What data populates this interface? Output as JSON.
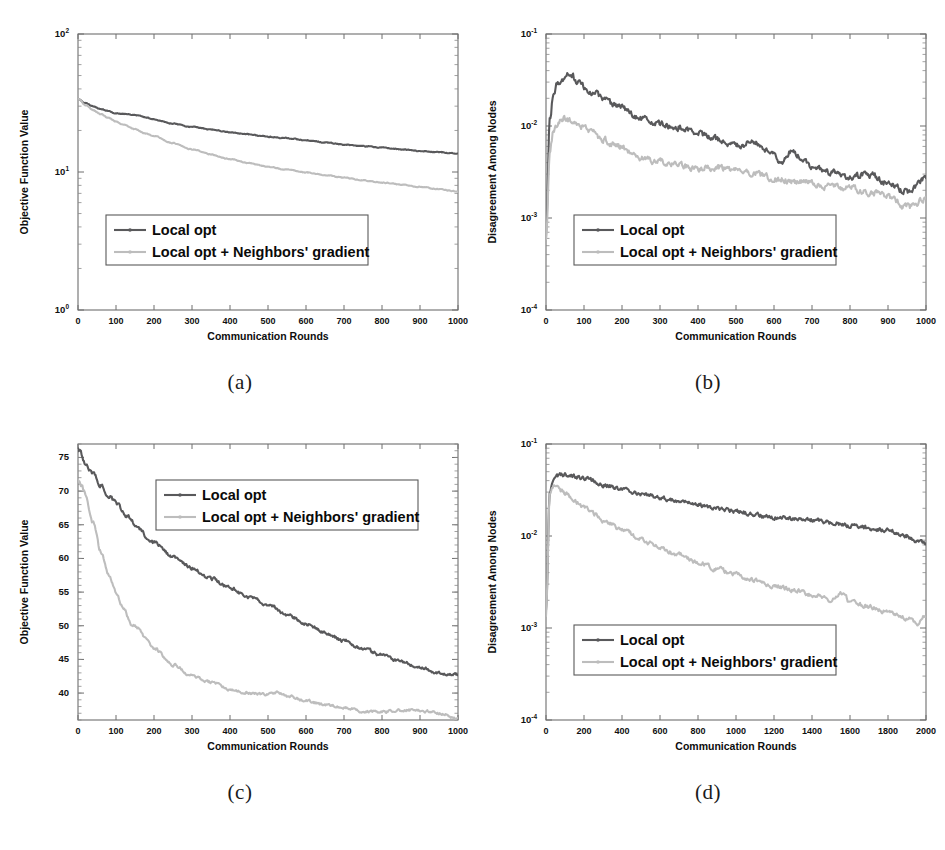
{
  "figure": {
    "background": "#ffffff",
    "colors": {
      "series_dark": "#59595b",
      "series_light": "#bdbdbd",
      "axis": "#6e6e6e",
      "text": "#111111",
      "legend_border": "#5a5a5a"
    },
    "legend_labels": {
      "local_opt": "Local opt",
      "local_opt_neighbors": "Local opt + Neighbors' gradient"
    },
    "axis_titles": {
      "x_rounds": "Communication Rounds",
      "y_objective": "Objective Function Value",
      "y_disagreement": "Disagreement Among Nodes"
    },
    "captions": {
      "a": "(a)",
      "b": "(b)",
      "c": "(c)",
      "d": "(d)"
    }
  },
  "chart_data": [
    {
      "id": "a",
      "type": "line",
      "title": "",
      "caption": "(a)",
      "xlabel": "Communication Rounds",
      "ylabel": "Objective Function Value",
      "xscale": "linear",
      "yscale": "log",
      "xlim": [
        0,
        1000
      ],
      "ylim": [
        1,
        100
      ],
      "xticks": [
        0,
        100,
        200,
        300,
        400,
        500,
        600,
        700,
        800,
        900,
        1000
      ],
      "xticklabels": [
        "0",
        "100",
        "200",
        "300",
        "400",
        "500",
        "600",
        "700",
        "800",
        "900",
        "1000"
      ],
      "yticks": [
        1,
        10,
        100
      ],
      "yticklabels": [
        "10^0",
        "10^1",
        "10^2"
      ],
      "grid": false,
      "legend_position": "lower-left",
      "noise": 0.006,
      "seed": 11,
      "series": [
        {
          "name": "Local opt",
          "color": "#59595b",
          "x": [
            0,
            20,
            40,
            60,
            80,
            100,
            120,
            150,
            180,
            200,
            250,
            300,
            350,
            400,
            450,
            500,
            550,
            600,
            650,
            700,
            750,
            800,
            850,
            900,
            950,
            1000
          ],
          "values": [
            34.0,
            31.5,
            29.8,
            28.6,
            27.6,
            26.6,
            26.3,
            25.9,
            24.8,
            24.0,
            22.4,
            21.2,
            20.3,
            19.4,
            18.7,
            18.0,
            17.6,
            17.0,
            16.4,
            15.8,
            15.4,
            15.0,
            14.6,
            14.2,
            13.9,
            13.6
          ]
        },
        {
          "name": "Local opt + Neighbors' gradient",
          "color": "#bdbdbd",
          "x": [
            0,
            20,
            40,
            60,
            80,
            100,
            120,
            150,
            180,
            200,
            250,
            300,
            350,
            400,
            450,
            500,
            550,
            600,
            650,
            700,
            750,
            800,
            850,
            900,
            950,
            1000
          ],
          "values": [
            34.0,
            30.5,
            28.0,
            26.2,
            24.6,
            23.2,
            22.0,
            20.4,
            19.0,
            18.2,
            16.2,
            14.6,
            13.4,
            12.4,
            11.6,
            10.9,
            10.4,
            9.9,
            9.5,
            9.1,
            8.7,
            8.4,
            8.1,
            7.8,
            7.5,
            7.2
          ]
        }
      ]
    },
    {
      "id": "b",
      "type": "line",
      "title": "",
      "caption": "(b)",
      "xlabel": "Communication Rounds",
      "ylabel": "Disagreement Among Nodes",
      "xscale": "linear",
      "yscale": "log",
      "xlim": [
        0,
        1000
      ],
      "ylim": [
        0.0001,
        0.1
      ],
      "xticks": [
        0,
        100,
        200,
        300,
        400,
        500,
        600,
        700,
        800,
        900,
        1000
      ],
      "xticklabels": [
        "0",
        "100",
        "200",
        "300",
        "400",
        "500",
        "600",
        "700",
        "800",
        "900",
        "1000"
      ],
      "yticks": [
        0.0001,
        0.001,
        0.01,
        0.1
      ],
      "yticklabels": [
        "10^-4",
        "10^-3",
        "10^-2",
        "10^-1"
      ],
      "grid": false,
      "legend_position": "lower-left",
      "noise": 0.065,
      "seed": 27,
      "series": [
        {
          "name": "Local opt",
          "color": "#59595b",
          "x": [
            0,
            10,
            20,
            30,
            40,
            50,
            60,
            70,
            80,
            100,
            120,
            150,
            180,
            200,
            220,
            250,
            300,
            350,
            400,
            450,
            500,
            550,
            600,
            620,
            650,
            660,
            680,
            700,
            750,
            800,
            850,
            900,
            950,
            1000
          ],
          "values": [
            0.0007,
            0.0115,
            0.024,
            0.029,
            0.031,
            0.034,
            0.037,
            0.034,
            0.031,
            0.027,
            0.024,
            0.02,
            0.0165,
            0.016,
            0.014,
            0.012,
            0.0105,
            0.0098,
            0.0082,
            0.0072,
            0.0062,
            0.0066,
            0.0048,
            0.004,
            0.0056,
            0.005,
            0.0044,
            0.0036,
            0.0031,
            0.0028,
            0.003,
            0.0024,
            0.0019,
            0.0027
          ]
        },
        {
          "name": "Local opt + Neighbors' gradient",
          "color": "#bdbdbd",
          "x": [
            0,
            10,
            20,
            30,
            40,
            50,
            60,
            80,
            100,
            120,
            150,
            180,
            200,
            220,
            250,
            300,
            350,
            400,
            450,
            500,
            550,
            600,
            650,
            700,
            750,
            800,
            850,
            900,
            950,
            1000
          ],
          "values": [
            0.0006,
            0.0055,
            0.009,
            0.0105,
            0.0115,
            0.0122,
            0.0118,
            0.0105,
            0.0098,
            0.0085,
            0.0072,
            0.0062,
            0.0058,
            0.0052,
            0.0046,
            0.0041,
            0.0038,
            0.0034,
            0.0036,
            0.0033,
            0.003,
            0.0027,
            0.0025,
            0.0024,
            0.0022,
            0.0021,
            0.0019,
            0.0017,
            0.0013,
            0.0016
          ]
        }
      ]
    },
    {
      "id": "c",
      "type": "line",
      "title": "",
      "caption": "(c)",
      "xlabel": "Communication Rounds",
      "ylabel": "Objective Function Value",
      "xscale": "linear",
      "yscale": "linear",
      "xlim": [
        0,
        1000
      ],
      "ylim": [
        36,
        77
      ],
      "xticks": [
        0,
        100,
        200,
        300,
        400,
        500,
        600,
        700,
        800,
        900,
        1000
      ],
      "xticklabels": [
        "0",
        "100",
        "200",
        "300",
        "400",
        "500",
        "600",
        "700",
        "800",
        "900",
        "1000"
      ],
      "yticks": [
        40,
        45,
        50,
        55,
        60,
        65,
        70,
        75
      ],
      "yticklabels": [
        "40",
        "45",
        "50",
        "55",
        "60",
        "65",
        "70",
        "75"
      ],
      "grid": false,
      "legend_position": "upper-center",
      "noise": 0.004,
      "seed": 41,
      "series": [
        {
          "name": "Local opt",
          "color": "#59595b",
          "x": [
            0,
            20,
            40,
            60,
            80,
            100,
            130,
            160,
            180,
            200,
            250,
            300,
            350,
            400,
            450,
            500,
            550,
            600,
            650,
            700,
            750,
            800,
            850,
            900,
            950,
            1000
          ],
          "values": [
            76.2,
            74.2,
            72.4,
            70.8,
            69.4,
            68.2,
            66.3,
            64.4,
            63.3,
            62.4,
            60.2,
            58.6,
            57.0,
            55.6,
            54.2,
            53.2,
            51.7,
            50.3,
            49.0,
            47.8,
            46.6,
            45.6,
            44.7,
            43.8,
            43.0,
            42.7
          ]
        },
        {
          "name": "Local opt + Neighbors' gradient",
          "color": "#bdbdbd",
          "x": [
            0,
            10,
            20,
            40,
            60,
            80,
            100,
            120,
            140,
            160,
            180,
            200,
            250,
            300,
            350,
            400,
            450,
            500,
            520,
            560,
            600,
            650,
            700,
            750,
            800,
            850,
            880,
            920,
            960,
            1000
          ],
          "values": [
            71.5,
            70.8,
            69.4,
            65.2,
            61.0,
            57.6,
            55.0,
            52.6,
            50.2,
            49.6,
            48.0,
            46.6,
            44.2,
            42.6,
            41.6,
            40.6,
            40.0,
            39.7,
            40.1,
            39.4,
            38.8,
            38.3,
            37.8,
            37.3,
            37.2,
            37.4,
            37.5,
            37.3,
            36.9,
            36.1
          ]
        }
      ]
    },
    {
      "id": "d",
      "type": "line",
      "title": "",
      "caption": "(d)",
      "xlabel": "Communication Rounds",
      "ylabel": "Disagreement Among Nodes",
      "xscale": "linear",
      "yscale": "log",
      "xlim": [
        0,
        2000
      ],
      "ylim": [
        0.0001,
        0.1
      ],
      "xticks": [
        0,
        200,
        400,
        600,
        800,
        1000,
        1200,
        1400,
        1600,
        1800,
        2000
      ],
      "xticklabels": [
        "0",
        "200",
        "400",
        "600",
        "800",
        "1000",
        "1200",
        "1400",
        "1600",
        "1800",
        "2000"
      ],
      "yticks": [
        0.0001,
        0.001,
        0.01,
        0.1
      ],
      "yticklabels": [
        "10^-4",
        "10^-3",
        "10^-2",
        "10^-1"
      ],
      "grid": false,
      "legend_position": "lower-left",
      "noise": 0.045,
      "seed": 73,
      "series": [
        {
          "name": "Local opt",
          "color": "#59595b",
          "x": [
            0,
            20,
            40,
            60,
            80,
            100,
            150,
            200,
            250,
            300,
            400,
            500,
            600,
            700,
            800,
            900,
            1000,
            1100,
            1200,
            1300,
            1400,
            1500,
            1600,
            1700,
            1800,
            1900,
            1950,
            2000
          ],
          "values": [
            0.0015,
            0.03,
            0.04,
            0.044,
            0.046,
            0.047,
            0.045,
            0.042,
            0.04,
            0.036,
            0.032,
            0.029,
            0.026,
            0.024,
            0.022,
            0.02,
            0.0185,
            0.0172,
            0.016,
            0.0152,
            0.0148,
            0.014,
            0.013,
            0.0122,
            0.0115,
            0.01,
            0.0086,
            0.0082
          ]
        },
        {
          "name": "Local opt + Neighbors' gradient",
          "color": "#bdbdbd",
          "x": [
            0,
            20,
            40,
            60,
            80,
            100,
            150,
            200,
            250,
            300,
            400,
            500,
            600,
            700,
            800,
            900,
            1000,
            1100,
            1200,
            1300,
            1400,
            1500,
            1560,
            1600,
            1700,
            1800,
            1900,
            1950,
            2000
          ],
          "values": [
            0.0014,
            0.028,
            0.034,
            0.033,
            0.031,
            0.029,
            0.024,
            0.02,
            0.0175,
            0.015,
            0.0118,
            0.0092,
            0.0074,
            0.0062,
            0.0052,
            0.0044,
            0.0038,
            0.0033,
            0.0029,
            0.0026,
            0.0023,
            0.002,
            0.0024,
            0.0019,
            0.0017,
            0.0015,
            0.0013,
            0.0011,
            0.0014
          ]
        }
      ]
    }
  ]
}
